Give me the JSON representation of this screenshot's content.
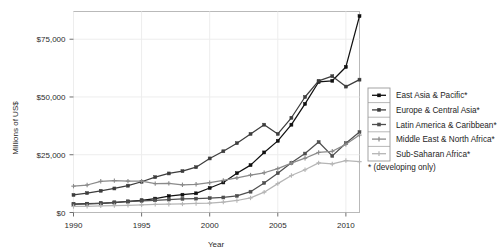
{
  "chart_data": {
    "type": "line",
    "title": "",
    "xlabel": "Year",
    "ylabel": "Millions of US$",
    "xlim": [
      1990,
      2011
    ],
    "ylim": [
      0,
      87000
    ],
    "grid": true,
    "legend_position": "right",
    "xticks": [
      1990,
      1995,
      2000,
      2005,
      2010
    ],
    "xtick_labels": [
      "1990",
      "1995",
      "2000",
      "2005",
      "2010"
    ],
    "yticks": [
      0,
      25000,
      50000,
      75000
    ],
    "ytick_labels": [
      "$0",
      "$25,000",
      "$50,000",
      "$75,000"
    ],
    "x": [
      1990,
      1991,
      1992,
      1993,
      1994,
      1995,
      1996,
      1997,
      1998,
      1999,
      2000,
      2001,
      2002,
      2003,
      2004,
      2005,
      2006,
      2007,
      2008,
      2009,
      2010,
      2011
    ],
    "series": [
      {
        "name": "East Asia & Pacific*",
        "color": "#111111",
        "marker": "square",
        "values": [
          3600,
          3800,
          4000,
          4300,
          4800,
          5300,
          6000,
          7100,
          7700,
          8300,
          10600,
          13000,
          17000,
          20500,
          26000,
          31000,
          38000,
          47000,
          56500,
          57000,
          63000,
          85000
        ]
      },
      {
        "name": "Europe & Central Asia*",
        "color": "#3d3d3d",
        "marker": "square",
        "values": [
          7600,
          8400,
          9400,
          10400,
          11600,
          13300,
          15300,
          16900,
          17900,
          19600,
          23400,
          26500,
          30000,
          34000,
          38000,
          34000,
          41000,
          50000,
          57000,
          59000,
          54500,
          57500
        ]
      },
      {
        "name": "Latin America & Caribbean*",
        "color": "#4f4f4f",
        "marker": "square",
        "values": [
          3500,
          3700,
          4000,
          4400,
          4700,
          5000,
          5300,
          5600,
          5900,
          6000,
          6200,
          6500,
          7200,
          9000,
          12800,
          17000,
          21500,
          25500,
          30500,
          24500,
          30000,
          34800
        ]
      },
      {
        "name": "Middle East & North Africa*",
        "color": "#8a8a8a",
        "marker": "plus",
        "values": [
          11400,
          11900,
          13500,
          13800,
          13600,
          13600,
          12500,
          12600,
          12000,
          12200,
          12900,
          13900,
          15000,
          16200,
          17200,
          19000,
          21400,
          23500,
          26000,
          26500,
          29500,
          33500
        ]
      },
      {
        "name": "Sub-Saharan Africa*",
        "color": "#b5b5b5",
        "marker": "plus",
        "values": [
          2600,
          2700,
          2900,
          3000,
          3100,
          3300,
          3500,
          3600,
          3700,
          3900,
          4100,
          4500,
          5200,
          6300,
          8800,
          12500,
          16000,
          18500,
          21500,
          21000,
          22500,
          22000
        ]
      }
    ],
    "footnote": "*  (developing only)"
  },
  "axes": {
    "y_title": "Millions of US$",
    "x_title": "Year"
  },
  "legend": {
    "entries": [
      {
        "label": "East Asia & Pacific*"
      },
      {
        "label": "Europe & Central Asia*"
      },
      {
        "label": "Latin America & Caribbean*"
      },
      {
        "label": "Middle East & North Africa*"
      },
      {
        "label": "Sub-Saharan Africa*"
      }
    ],
    "note": "*  (developing only)"
  }
}
